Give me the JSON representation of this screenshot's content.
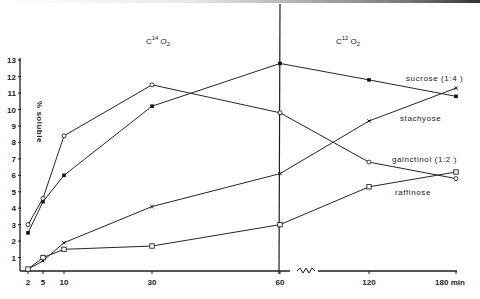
{
  "chart_data": {
    "type": "line",
    "title": "",
    "xlabel": "min",
    "ylabel": "% soluble",
    "ylim": [
      0,
      13
    ],
    "yticks": [
      1,
      2,
      3,
      4,
      5,
      6,
      7,
      8,
      9,
      10,
      11,
      12,
      13
    ],
    "x": [
      2,
      5,
      10,
      30,
      60,
      120,
      180
    ],
    "xtick_labels": [
      "2",
      "5",
      "10",
      "30",
      "60",
      "120",
      "180 min"
    ],
    "axis_break_after": 60,
    "phases": [
      {
        "label": "C14O2",
        "base": "C",
        "sup": "14",
        "rest": "O",
        "sub": "2"
      },
      {
        "label": "C12O2",
        "base": "C",
        "sup": "12",
        "rest": "O",
        "sub": "2"
      }
    ],
    "series": [
      {
        "name": "sucrose (1:4)",
        "marker": "filled-square",
        "values": [
          2.5,
          4.4,
          6.0,
          10.2,
          12.8,
          11.8,
          10.8
        ]
      },
      {
        "name": "galactinol (1:2)",
        "marker": "open-circle",
        "values": [
          3.0,
          4.6,
          8.4,
          11.5,
          9.8,
          6.8,
          5.8
        ]
      },
      {
        "name": "stachyose",
        "marker": "x",
        "values": [
          0.3,
          0.8,
          1.9,
          4.1,
          6.1,
          9.3,
          11.3
        ]
      },
      {
        "name": "raffinose",
        "marker": "open-square",
        "values": [
          0.3,
          1.0,
          1.5,
          1.7,
          3.0,
          5.3,
          6.2
        ]
      }
    ],
    "grid": false,
    "legend": "inline labels near line ends"
  },
  "labels": {
    "ylabel": "% soluble",
    "phase_left": {
      "base": "C",
      "sup": "14",
      "rest": "O",
      "sub": "2"
    },
    "phase_right": {
      "base": "C",
      "sup": "12",
      "rest": "O",
      "sub": "2"
    },
    "sucrose": "sucrose (1:4 )",
    "stachyose": "stachyose",
    "galactinol": "galnctinol (1:2 )",
    "raffinose": "raffinose"
  }
}
